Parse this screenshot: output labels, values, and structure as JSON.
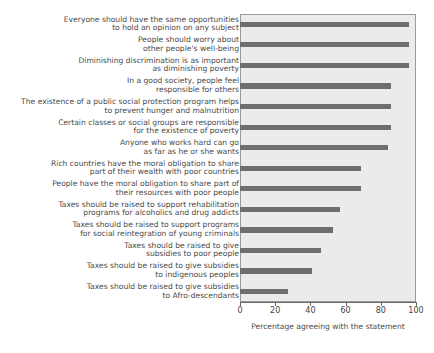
{
  "header_remnant": "",
  "chart_data": {
    "type": "bar",
    "orientation": "horizontal",
    "title": "",
    "xlabel": "Percentage agreeing with the statement",
    "ylabel": "",
    "xlim": [
      0,
      100
    ],
    "xticks": [
      0,
      20,
      40,
      60,
      80,
      100
    ],
    "grid": false,
    "legend": null,
    "bar_color": "#6e6e6e",
    "plot_background": "#ebebeb",
    "categories": [
      "Everyone should have the same opportunities\nto hold an opinion on any subject",
      "People should worry about\nother people's well-being",
      "Diminishing discrimination is as important\nas diminishing poverty",
      "In a good society, people feel\nresponsible for others",
      "The existence of a public social protection program helps\nto prevent hunger and malnutrition",
      "Certain classes or social groups are responsible\nfor the existence of poverty",
      "Anyone who works hard can go\nas far as he or she wants",
      "Rich countries have the moral obligation to share\npart of their wealth with poor countries",
      "People have the moral obligation to share part of\ntheir resources with poor people",
      "Taxes should be raised to support rehabilitation\nprograms for alcoholics and drug addicts",
      "Taxes should be raised to support programs\nfor social reintegration of young criminals",
      "Taxes should be raised to give\nsubsidies to poor people",
      "Taxes should be raised to give subsidies\nto indigenous peoples",
      "Taxes should be raised to give subsidies\nto Afro-descendants"
    ],
    "values": [
      96,
      96,
      96,
      86,
      86,
      86,
      84,
      69,
      69,
      57,
      53,
      46,
      41,
      27
    ]
  }
}
